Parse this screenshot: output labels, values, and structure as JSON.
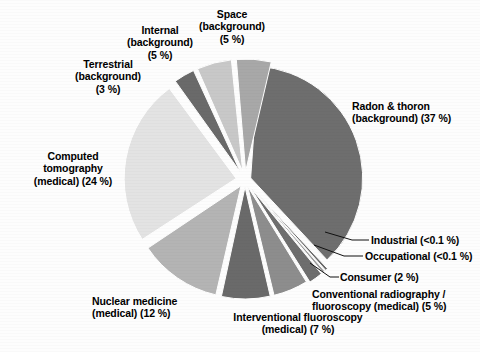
{
  "chart_data": {
    "type": "pie",
    "title": "",
    "subtitle": "",
    "xlabel": "",
    "ylabel": "",
    "legend_position": "none",
    "grid": false,
    "exploded": true,
    "units": "percent",
    "categories": [
      "Radon & thoron (background)",
      "Industrial",
      "Occupational",
      "Consumer",
      "Conventional radiography / fluoroscopy (medical)",
      "Interventional fluoroscopy (medical)",
      "Nuclear medicine (medical)",
      "Computed tomography (medical)",
      "Terrestrial (background)",
      "Internal (background)",
      "Space (background)"
    ],
    "values": [
      37,
      0.05,
      0.05,
      2,
      5,
      7,
      12,
      24,
      3,
      5,
      5
    ],
    "value_labels": [
      "37 %",
      "<0.1 %",
      "<0.1 %",
      "2 %",
      "5 %",
      "7 %",
      "12 %",
      "24 %",
      "3 %",
      "5 %",
      "5 %"
    ],
    "colors": [
      "#6e6e6e",
      "#6a6a6a",
      "#9a9a9a",
      "#6e6e6e",
      "#8d8d8d",
      "#6a6a6a",
      "#b4b4b4",
      "#e3e3e3",
      "#6a6a6a",
      "#c8c8c8",
      "#a8a8a8"
    ],
    "slices": [
      {
        "name": "radon-thoron",
        "label_line1": "Radon & thoron",
        "label_line2": "(background)  (37 %)",
        "value": 37,
        "value_label": "37 %",
        "color": "#6e6e6e",
        "start_angle": -86,
        "end_angle": 47,
        "explode": 6
      },
      {
        "name": "industrial",
        "label_line1": "Industrial (<0.1 %)",
        "label_line2": "",
        "value": 0.05,
        "value_label": "<0.1 %",
        "color": "#6a6a6a",
        "start_angle": 47,
        "end_angle": 48.3,
        "explode": 9
      },
      {
        "name": "occupational",
        "label_line1": "Occupational (<0.1 %)",
        "label_line2": "",
        "value": 0.05,
        "value_label": "<0.1 %",
        "color": "#9a9a9a",
        "start_angle": 48.8,
        "end_angle": 50.1,
        "explode": 9
      },
      {
        "name": "consumer",
        "label_line1": "Consumer (2 %)",
        "label_line2": "",
        "value": 2,
        "value_label": "2 %",
        "color": "#6e6e6e",
        "start_angle": 50.6,
        "end_angle": 57.8,
        "explode": 9
      },
      {
        "name": "conventional-radiography",
        "label_line1": "Conventional radiography /",
        "label_line2": "fluoroscopy (medical) (5 %)",
        "value": 5,
        "value_label": "5 %",
        "color": "#8d8d8d",
        "start_angle": 58.4,
        "end_angle": 76.4,
        "explode": 7
      },
      {
        "name": "interventional-fluoroscopy",
        "label_line1": "Interventional  fluoroscopy",
        "label_line2": "(medical) (7 %)",
        "value": 7,
        "value_label": "7 %",
        "color": "#6a6a6a",
        "start_angle": 77,
        "end_angle": 102.2,
        "explode": 7
      },
      {
        "name": "nuclear-medicine",
        "label_line1": "Nuclear medicine",
        "label_line2": "(medical) (12 %)",
        "value": 12,
        "value_label": "12 %",
        "color": "#b4b4b4",
        "start_angle": 103,
        "end_angle": 146.2,
        "explode": 7
      },
      {
        "name": "computed-tomography",
        "label_line1": "Computed",
        "label_line2": "tomography",
        "label_line3": "(medical) (24 %)",
        "value": 24,
        "value_label": "24 %",
        "color": "#e3e3e3",
        "start_angle": 147,
        "end_angle": 233.4,
        "explode": 9
      },
      {
        "name": "terrestrial",
        "label_line1": "Terrestrial",
        "label_line2": "(background)",
        "label_line3": "(3 %)",
        "value": 3,
        "value_label": "3 %",
        "color": "#6a6a6a",
        "start_angle": 234.4,
        "end_angle": 245.2,
        "explode": 9
      },
      {
        "name": "internal",
        "label_line1": "Internal",
        "label_line2": "(background)",
        "label_line3": "(5 %)",
        "value": 5,
        "value_label": "5 %",
        "color": "#c8c8c8",
        "start_angle": 246.2,
        "end_angle": 264.2,
        "explode": 9
      },
      {
        "name": "space",
        "label_line1": "Space",
        "label_line2": "(background)",
        "label_line3": "(5 %)",
        "value": 5,
        "value_label": "5 %",
        "color": "#a8a8a8",
        "start_angle": 265.2,
        "end_angle": 283.2,
        "explode": 9
      }
    ],
    "center": {
      "x": 245,
      "y": 180
    },
    "radius": 112
  },
  "labels": {
    "space": "Space\n(background)\n(5 %)",
    "internal": "Internal\n(background)\n(5 %)",
    "terrestrial": "Terrestrial\n(background)\n(3 %)",
    "radon": "Radon & thoron\n(background)  (37 %)",
    "computed_tomography": "Computed\ntomography\n(medical) (24 %)",
    "industrial": "Industrial (<0.1 %)",
    "occupational": "Occupational (<0.1 %)",
    "consumer": "Consumer (2 %)",
    "conventional_radiography": "Conventional radiography /\nfluoroscopy (medical) (5 %)",
    "interventional_fluoroscopy": "Interventional  fluoroscopy\n(medical) (7 %)",
    "nuclear_medicine": "Nuclear medicine\n(medical) (12 %)"
  }
}
